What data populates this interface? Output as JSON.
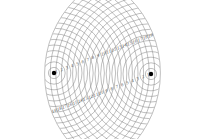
{
  "diagram": {
    "background": "#ffffff",
    "ring_color": "#8a8a8a",
    "source_color": "#000000",
    "sources": [
      {
        "name": "left-source",
        "x": 54,
        "y": 73
      },
      {
        "name": "right-source",
        "x": 151,
        "y": 74
      }
    ],
    "ring_spacing": 5.6,
    "ring_count": 19,
    "clip_radius": 66,
    "label_lines": [
      {
        "name": "upper-label-line",
        "from_source": 0,
        "direction_deg": -21,
        "labels": [
          "1",
          "2",
          "3",
          "4",
          "5",
          "6",
          "7",
          "8",
          "9",
          "10",
          "11",
          "12",
          "13",
          "14",
          "15",
          "16",
          "17",
          "18",
          "19"
        ]
      },
      {
        "name": "lower-label-line",
        "from_source": 1,
        "direction_deg": 159,
        "labels": [
          "1",
          "2",
          "3",
          "4",
          "5",
          "6",
          "7",
          "8",
          "9",
          "10",
          "11",
          "12",
          "13",
          "14",
          "15",
          "16",
          "17",
          "18",
          "19"
        ]
      }
    ]
  }
}
